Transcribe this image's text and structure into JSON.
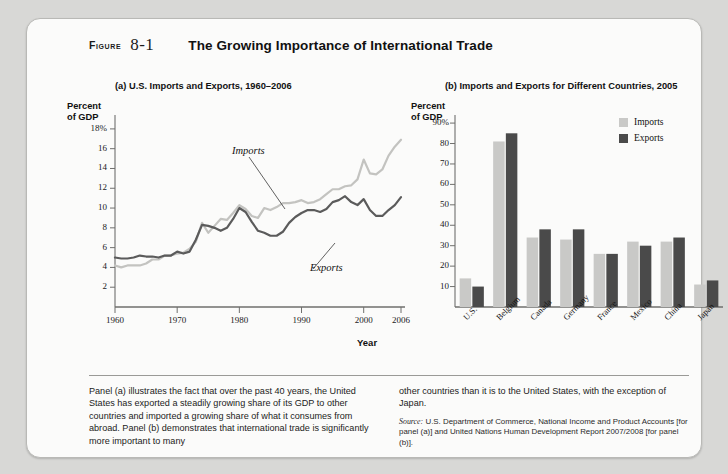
{
  "figure": {
    "label": "FIGURE",
    "number": "8-1",
    "title": "The Growing Importance of International Trade"
  },
  "panel_a": {
    "title": "(a) U.S. Imports and Exports, 1960–2006",
    "y_axis_title": "Percent\nof GDP",
    "x_axis_title": "Year",
    "annot_imports": "Imports",
    "annot_exports": "Exports"
  },
  "panel_b": {
    "title": "(b) Imports and Exports for Different Countries, 2005",
    "y_axis_title": "Percent\nof GDP",
    "legend": [
      {
        "name": "Imports",
        "color": "#c9c9c7"
      },
      {
        "name": "Exports",
        "color": "#4a4a4a"
      }
    ]
  },
  "caption": {
    "left": "Panel (a) illustrates the fact that over the past 40 years, the United States has exported a steadily growing share of its GDP to other countries and imported a growing share of what it consumes from abroad. Panel (b) demonstrates that international trade is significantly more important to many",
    "right": "other countries than it is to the United States, with the exception of Japan.",
    "source_prefix": "Source:",
    "source_text": " U.S. Department of Commerce, National Income and Product Accounts [for panel (a)] and United Nations Human Development Report 2007/2008 [for panel (b)]."
  },
  "chart_data": [
    {
      "type": "line",
      "id": "panel-a",
      "title": "(a) U.S. Imports and Exports, 1960–2006",
      "xlabel": "Year",
      "ylabel": "Percent of GDP",
      "xlim": [
        1960,
        2006
      ],
      "ylim": [
        0,
        19
      ],
      "yticks": [
        2,
        4,
        6,
        8,
        10,
        12,
        14,
        16,
        18
      ],
      "ytick_labels": [
        "2",
        "4",
        "6",
        "8",
        "10",
        "12",
        "14",
        "16",
        "18%"
      ],
      "xticks": [
        1960,
        1970,
        1980,
        1990,
        2000,
        2006
      ],
      "grid": false,
      "legend": "inline-annotations",
      "x": [
        1960,
        1961,
        1962,
        1963,
        1964,
        1965,
        1966,
        1967,
        1968,
        1969,
        1970,
        1971,
        1972,
        1973,
        1974,
        1975,
        1976,
        1977,
        1978,
        1979,
        1980,
        1981,
        1982,
        1983,
        1984,
        1985,
        1986,
        1987,
        1988,
        1989,
        1990,
        1991,
        1992,
        1993,
        1994,
        1995,
        1996,
        1997,
        1998,
        1999,
        2000,
        2001,
        2002,
        2003,
        2004,
        2005,
        2006
      ],
      "series": [
        {
          "name": "Imports",
          "color": "#c3c3c0",
          "values": [
            4.2,
            4.0,
            4.2,
            4.2,
            4.2,
            4.4,
            4.8,
            4.8,
            5.2,
            5.2,
            5.4,
            5.5,
            5.9,
            6.6,
            8.5,
            7.5,
            8.2,
            8.9,
            8.8,
            9.5,
            10.3,
            9.9,
            9.2,
            9.0,
            10.0,
            9.8,
            10.1,
            10.5,
            10.5,
            10.6,
            10.8,
            10.5,
            10.6,
            10.9,
            11.4,
            11.9,
            11.9,
            12.2,
            12.3,
            12.9,
            14.9,
            13.5,
            13.4,
            13.9,
            15.3,
            16.2,
            16.9
          ]
        },
        {
          "name": "Exports",
          "color": "#5b5b5b",
          "values": [
            5.0,
            4.9,
            4.9,
            5.0,
            5.2,
            5.1,
            5.1,
            5.0,
            5.2,
            5.2,
            5.6,
            5.4,
            5.6,
            6.8,
            8.3,
            8.2,
            8.0,
            7.7,
            8.0,
            8.9,
            10.0,
            9.6,
            8.6,
            7.7,
            7.5,
            7.2,
            7.2,
            7.6,
            8.5,
            9.1,
            9.5,
            9.8,
            9.8,
            9.6,
            9.9,
            10.6,
            10.8,
            11.2,
            10.6,
            10.3,
            10.9,
            9.8,
            9.2,
            9.2,
            9.8,
            10.3,
            11.1
          ]
        }
      ]
    },
    {
      "type": "bar",
      "id": "panel-b",
      "title": "(b) Imports and Exports for Different Countries, 2005",
      "xlabel": "",
      "ylabel": "Percent of GDP",
      "ylim": [
        0,
        92
      ],
      "yticks": [
        10,
        20,
        30,
        40,
        50,
        60,
        70,
        80,
        90
      ],
      "ytick_labels": [
        "10",
        "20",
        "30",
        "40",
        "50",
        "60",
        "70",
        "80",
        "90%"
      ],
      "grid": false,
      "legend_position": "top-right",
      "categories": [
        "U.S.",
        "Belgium",
        "Canada",
        "Germany",
        "France",
        "Mexico",
        "China",
        "Japan"
      ],
      "series": [
        {
          "name": "Imports",
          "color": "#c9c9c7",
          "values": [
            14,
            81,
            34,
            33,
            26,
            32,
            32,
            11
          ]
        },
        {
          "name": "Exports",
          "color": "#4a4a4a",
          "values": [
            10,
            85,
            38,
            38,
            26,
            30,
            34,
            13
          ]
        }
      ]
    }
  ]
}
